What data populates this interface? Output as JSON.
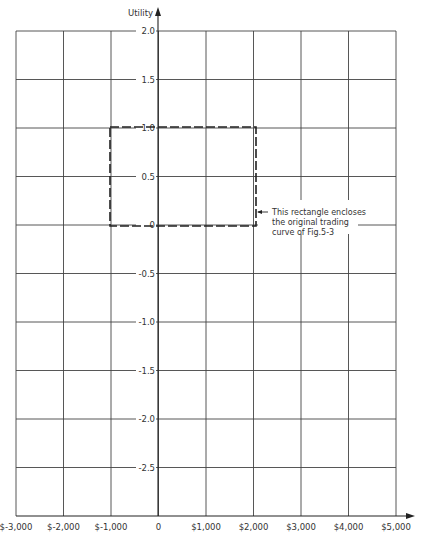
{
  "chart_data": {
    "type": "line",
    "title": "",
    "xlabel": "",
    "ylabel": "Utility",
    "xlim": [
      -3000,
      5000
    ],
    "ylim": [
      -3.0,
      2.0
    ],
    "grid": true,
    "x_ticks": [
      "$-3,000",
      "$-2,000",
      "$-1,000",
      "0",
      "$1,000",
      "$2,000",
      "$3,000",
      "$4,000",
      "$5,000"
    ],
    "y_ticks": [
      "2.0",
      "1.5",
      "1.0",
      "0.5",
      "0",
      "-0.5",
      "-1.0",
      "-1.5",
      "-2.0",
      "-2.5"
    ],
    "shapes": [
      {
        "type": "dashed-rectangle",
        "x0": -1000,
        "x1": 2000,
        "y0": 0,
        "y1": 1.0
      }
    ],
    "annotations": [
      {
        "text_lines": [
          "This rectangle encloses",
          "the original trading",
          "curve of Fig.5-3"
        ],
        "points_to": {
          "x": 2000,
          "y": 0.1
        }
      }
    ]
  },
  "axis": {
    "y_label": "Utility"
  },
  "annotation": {
    "line1": "This rectangle encloses",
    "line2": "the original trading",
    "line3": "curve of Fig.5-3"
  },
  "colors": {
    "grid": "#444444",
    "text": "#333333",
    "background": "#ffffff"
  }
}
